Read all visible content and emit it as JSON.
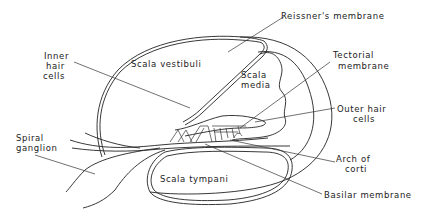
{
  "diagram": {
    "colors": {
      "stroke": "#222222",
      "background": "#ffffff"
    },
    "regions": {
      "scala_vestibuli": "Scala   vestibuli",
      "scala_media_line1": "Scala",
      "scala_media_line2": "media",
      "scala_tympani": "Scala  tympani"
    },
    "callouts": {
      "reissners": "Reissner's   membrane",
      "tectorial_line1": "Tectorial",
      "tectorial_line2": "membrane",
      "inner_hair_line1": "Inner",
      "inner_hair_line2": "hair",
      "inner_hair_line3": "cells",
      "outer_hair_line1": "Outer  hair",
      "outer_hair_line2": "cells",
      "spiral_line1": "Spiral",
      "spiral_line2": "ganglion",
      "arch_line1": "Arch of",
      "arch_line2": "corti",
      "basilar": "Basilar   membrane"
    }
  }
}
